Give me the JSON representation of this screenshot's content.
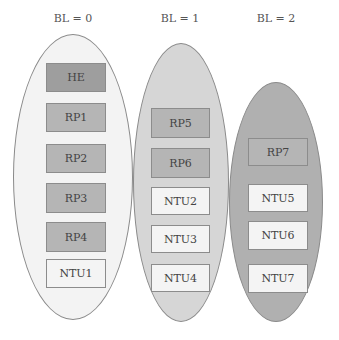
{
  "diagram": {
    "groups": [
      {
        "label": "BL = 0",
        "fill": "#f3f3f3",
        "ellipse": {
          "x": 13,
          "y": 34,
          "w": 120,
          "h": 286
        },
        "label_pos": {
          "x": 43,
          "y": 12
        },
        "nodes": [
          {
            "text": "HE",
            "kind": "he",
            "x": 46,
            "y": 63,
            "w": 60,
            "h": 29
          },
          {
            "text": "RP1",
            "kind": "rp",
            "x": 46,
            "y": 103,
            "w": 60,
            "h": 29
          },
          {
            "text": "RP2",
            "kind": "rp",
            "x": 46,
            "y": 144,
            "w": 60,
            "h": 29
          },
          {
            "text": "RP3",
            "kind": "rp",
            "x": 46,
            "y": 183,
            "w": 60,
            "h": 30
          },
          {
            "text": "RP4",
            "kind": "rp",
            "x": 46,
            "y": 222,
            "w": 60,
            "h": 30
          },
          {
            "text": "NTU1",
            "kind": "ntu",
            "x": 46,
            "y": 259,
            "w": 60,
            "h": 29
          }
        ]
      },
      {
        "label": "BL = 1",
        "fill": "#d6d6d6",
        "ellipse": {
          "x": 133,
          "y": 43,
          "w": 96,
          "h": 279
        },
        "label_pos": {
          "x": 150,
          "y": 12
        },
        "nodes": [
          {
            "text": "RP5",
            "kind": "rp",
            "x": 151,
            "y": 108,
            "w": 59,
            "h": 30
          },
          {
            "text": "RP6",
            "kind": "rp",
            "x": 151,
            "y": 148,
            "w": 59,
            "h": 30
          },
          {
            "text": "NTU2",
            "kind": "ntu",
            "x": 151,
            "y": 187,
            "w": 59,
            "h": 28
          },
          {
            "text": "NTU3",
            "kind": "ntu",
            "x": 151,
            "y": 225,
            "w": 59,
            "h": 28
          },
          {
            "text": "NTU4",
            "kind": "ntu",
            "x": 151,
            "y": 264,
            "w": 59,
            "h": 28
          }
        ]
      },
      {
        "label": "BL = 2",
        "fill": "#b0b0b0",
        "ellipse": {
          "x": 229,
          "y": 82,
          "w": 94,
          "h": 240
        },
        "label_pos": {
          "x": 246,
          "y": 12
        },
        "nodes": [
          {
            "text": "RP7",
            "kind": "rp",
            "x": 248,
            "y": 138,
            "w": 60,
            "h": 28
          },
          {
            "text": "NTU5",
            "kind": "ntu",
            "x": 248,
            "y": 184,
            "w": 60,
            "h": 28
          },
          {
            "text": "NTU6",
            "kind": "ntu",
            "x": 248,
            "y": 221,
            "w": 60,
            "h": 29
          },
          {
            "text": "NTU7",
            "kind": "ntu",
            "x": 248,
            "y": 264,
            "w": 60,
            "h": 29
          }
        ]
      }
    ]
  }
}
